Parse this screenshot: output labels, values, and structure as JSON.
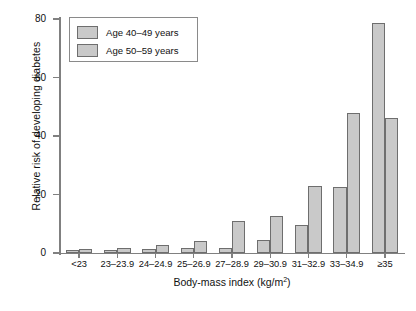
{
  "chart_data": {
    "type": "bar",
    "title": "",
    "xlabel": "Body-mass index (kg/m2)",
    "xlabel_base": "Body-mass index (kg/m",
    "xlabel_sup": "2",
    "xlabel_tail": ")",
    "ylabel": "Relative risk of developing diabetes",
    "categories": [
      "<23",
      "23–23.9",
      "24–24.9",
      "25–26.9",
      "27–28.9",
      "29–30.9",
      "31–32.9",
      "33–34.9",
      "≥35"
    ],
    "series": [
      {
        "name": "Age 40–49 years",
        "color": "#c9c9c9",
        "values": [
          1.0,
          0.9,
          1.3,
          1.7,
          1.8,
          4.4,
          9.5,
          22.5,
          78.5
        ]
      },
      {
        "name": "Age 50–59 years",
        "color": "#c9c9c9",
        "values": [
          1.5,
          1.6,
          2.7,
          4.2,
          11.0,
          12.5,
          23.0,
          48.0,
          46.0
        ]
      }
    ],
    "ylim": [
      0,
      80
    ],
    "yticks": [
      0,
      20,
      40,
      60,
      80
    ],
    "ytick_labels": [
      "0",
      "20",
      "40",
      "60",
      "80"
    ],
    "grid": false,
    "legend_position": "top-left",
    "bar_edge_color": "#6e6e6e",
    "axis_color": "#808080"
  },
  "legend": {
    "items": [
      {
        "label": "Age 40–49 years"
      },
      {
        "label": "Age 50–59 years"
      }
    ]
  }
}
